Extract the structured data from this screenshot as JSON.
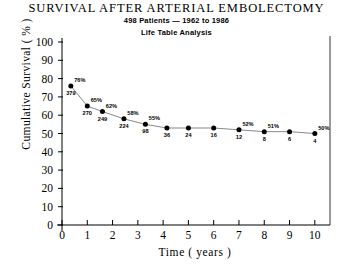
{
  "chart_data": {
    "type": "line",
    "title": "SURVIVAL AFTER ARTERIAL EMBOLECTOMY",
    "subtitle": "498 Patients  —  1962 to 1986",
    "subtitle2": "Life Table Analysis",
    "xlabel": "Time ( years )",
    "ylabel": "Cumulative Survival ( % )",
    "xlim": [
      0,
      10.6
    ],
    "ylim": [
      0,
      100
    ],
    "grid": false,
    "legend": null,
    "xticks": [
      "0",
      "1",
      "2",
      "3",
      "4",
      "5",
      "6",
      "7",
      "8",
      "9",
      "10"
    ],
    "xtick_values": [
      0,
      1,
      2,
      3,
      4,
      5,
      6,
      7,
      8,
      9,
      10
    ],
    "yticks": [
      "0",
      "10",
      "20",
      "30",
      "40",
      "50",
      "60",
      "70",
      "80",
      "90",
      "100"
    ],
    "ytick_values": [
      0,
      10,
      20,
      30,
      40,
      50,
      60,
      70,
      80,
      90,
      100
    ],
    "x": [
      0.35,
      1.0,
      1.6,
      2.45,
      3.3,
      4.15,
      5.0,
      6.0,
      7.0,
      8.0,
      9.0,
      10.0
    ],
    "values": [
      76,
      65,
      62,
      58,
      55,
      53,
      53,
      53,
      52,
      51,
      51,
      50
    ],
    "point_labels": [
      "76%",
      "65%",
      "62%",
      "58%",
      "55%",
      "",
      "",
      "",
      "52%",
      "51%",
      "",
      "50%"
    ],
    "at_risk": [
      "379",
      "270",
      "249",
      "224",
      "98",
      "36",
      "24",
      "16",
      "12",
      "8",
      "6",
      "4"
    ],
    "series_name": "Cumulative Survival"
  },
  "colors": {
    "axis": "#000000",
    "point": "#000000",
    "line": "#555555",
    "background": "#ffffff"
  }
}
